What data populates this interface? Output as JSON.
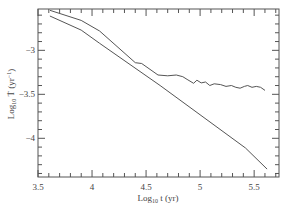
{
  "chart_data": {
    "type": "line",
    "title": "",
    "xlabel": "Log10 t (yr)",
    "ylabel": "Log10 Ṫ (yr^-1)",
    "xlim": [
      3.5,
      5.73
    ],
    "ylim": [
      -4.44,
      -2.53
    ],
    "grid": false,
    "legend": null,
    "x_ticks": [
      3.5,
      4,
      4.5,
      5,
      5.5
    ],
    "x_tick_labels": [
      "3.5",
      "4",
      "4.5",
      "5",
      "5.5"
    ],
    "y_ticks": [
      -3,
      -3.5,
      -4
    ],
    "y_tick_labels": [
      "-3",
      "-3.5",
      "-4"
    ],
    "x_minor_step": 0.1,
    "y_minor_step": 0.1,
    "series": [
      {
        "name": "upper",
        "color": "#555555",
        "x": [
          3.61,
          3.9,
          4.07,
          4.4,
          4.46,
          4.61,
          4.7,
          4.78,
          4.84,
          4.88,
          4.94,
          4.97,
          5.01,
          5.05,
          5.09,
          5.13,
          5.19,
          5.24,
          5.29,
          5.33,
          5.37,
          5.41,
          5.44,
          5.48,
          5.52,
          5.56,
          5.6
        ],
        "y": [
          -2.545,
          -2.66,
          -2.78,
          -3.14,
          -3.15,
          -3.28,
          -3.29,
          -3.28,
          -3.3,
          -3.33,
          -3.375,
          -3.34,
          -3.37,
          -3.36,
          -3.4,
          -3.38,
          -3.39,
          -3.41,
          -3.4,
          -3.42,
          -3.43,
          -3.41,
          -3.4,
          -3.42,
          -3.41,
          -3.42,
          -3.455
        ]
      },
      {
        "name": "lower",
        "color": "#555555",
        "x": [
          3.61,
          3.9,
          4.07,
          4.63,
          5.42,
          5.62
        ],
        "y": [
          -2.61,
          -2.77,
          -2.92,
          -3.4,
          -4.11,
          -4.35
        ]
      }
    ]
  },
  "labels": {
    "x_main": "Log",
    "x_sub": "10",
    "x_rest": " t (yr)",
    "y_main": "Log",
    "y_sub": "10",
    "y_rest": " Ṫ (yr",
    "y_sup": "−1",
    "y_close": ")"
  }
}
